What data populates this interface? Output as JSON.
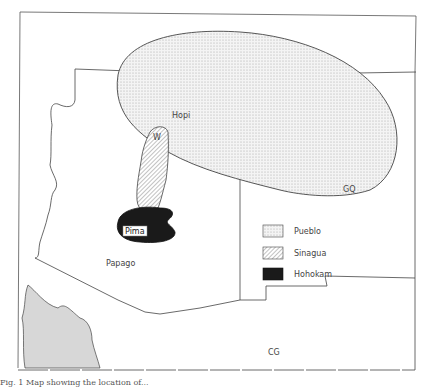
{
  "map": {
    "labels": {
      "hopi": "Hopi",
      "w": "W",
      "gq": "GQ",
      "pima": "Pima",
      "papago": "Papago",
      "cg": "CG"
    },
    "legend": [
      {
        "label": "Pueblo",
        "pattern": "stipple"
      },
      {
        "label": "Sinagua",
        "pattern": "diagonal-hatch"
      },
      {
        "label": "Hohokam",
        "pattern": "solid-dark"
      }
    ],
    "colors": {
      "line": "#444444",
      "hohokam_fill": "#1a1a1a",
      "stipple": "#9a9a9a",
      "background": "#ffffff"
    }
  },
  "caption": "Fig. 1 Map showing the location of..."
}
